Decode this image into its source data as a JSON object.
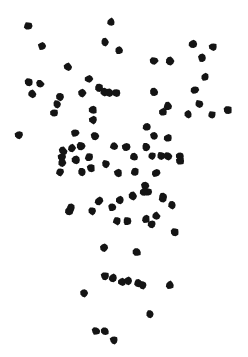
{
  "chart_data": {
    "type": "scatter",
    "title": "",
    "subtitle": "",
    "xlabel": "",
    "ylabel": "",
    "xlim": [
      0,
      248
    ],
    "ylim": [
      0,
      357
    ],
    "grid": false,
    "axes_visible": false,
    "tick_labels_x": [],
    "tick_labels_y": [],
    "legend": [],
    "legend_position": "none",
    "annotations": [],
    "marker": {
      "shape": "filled-irregular-circle",
      "color": "#141414",
      "size_px": 8
    },
    "background_color": "#ffffff",
    "point_count": 96,
    "series": [
      {
        "name": "points",
        "color": "#141414",
        "points": [
          [
            28,
            26
          ],
          [
            111,
            22
          ],
          [
            42,
            46
          ],
          [
            105,
            42
          ],
          [
            119,
            50
          ],
          [
            193,
            44
          ],
          [
            213,
            47
          ],
          [
            202,
            58
          ],
          [
            68,
            67
          ],
          [
            154,
            61
          ],
          [
            170,
            61
          ],
          [
            29,
            82
          ],
          [
            40,
            84
          ],
          [
            32,
            94
          ],
          [
            60,
            97
          ],
          [
            82,
            93
          ],
          [
            99,
            88
          ],
          [
            104,
            92
          ],
          [
            109,
            93
          ],
          [
            116,
            93
          ],
          [
            154,
            92
          ],
          [
            195,
            90
          ],
          [
            54,
            113
          ],
          [
            93,
            110
          ],
          [
            93,
            120
          ],
          [
            168,
            106
          ],
          [
            212,
            115
          ],
          [
            228,
            110
          ],
          [
            19,
            135
          ],
          [
            75,
            133
          ],
          [
            95,
            136
          ],
          [
            147,
            127
          ],
          [
            154,
            136
          ],
          [
            168,
            138
          ],
          [
            72,
            148
          ],
          [
            81,
            146
          ],
          [
            63,
            151
          ],
          [
            62,
            157
          ],
          [
            62,
            163
          ],
          [
            114,
            146
          ],
          [
            126,
            147
          ],
          [
            134,
            157
          ],
          [
            152,
            156
          ],
          [
            161,
            156
          ],
          [
            168,
            156
          ],
          [
            180,
            156
          ],
          [
            60,
            172
          ],
          [
            82,
            172
          ],
          [
            91,
            168
          ],
          [
            118,
            173
          ],
          [
            135,
            172
          ],
          [
            145,
            186
          ],
          [
            148,
            192
          ],
          [
            163,
            197
          ],
          [
            69,
            211
          ],
          [
            92,
            211
          ],
          [
            120,
            200
          ],
          [
            144,
            192
          ],
          [
            163,
            198
          ],
          [
            172,
            205
          ],
          [
            117,
            221
          ],
          [
            127,
            221
          ],
          [
            146,
            219
          ],
          [
            152,
            224
          ],
          [
            175,
            232
          ],
          [
            104,
            248
          ],
          [
            137,
            252
          ],
          [
            105,
            276
          ],
          [
            113,
            278
          ],
          [
            122,
            282
          ],
          [
            128,
            281
          ],
          [
            138,
            283
          ],
          [
            143,
            285
          ],
          [
            170,
            285
          ],
          [
            84,
            293
          ],
          [
            150,
            314
          ],
          [
            96,
            331
          ],
          [
            105,
            331
          ],
          [
            114,
            340
          ],
          [
            89,
            79
          ],
          [
            57,
            104
          ],
          [
            205,
            77
          ],
          [
            163,
            112
          ],
          [
            188,
            114
          ],
          [
            76,
            160
          ],
          [
            89,
            157
          ],
          [
            106,
            164
          ],
          [
            133,
            196
          ],
          [
            156,
            216
          ],
          [
            99,
            201
          ],
          [
            71,
            208
          ],
          [
            180,
            161
          ],
          [
            146,
            147
          ],
          [
            199,
            104
          ],
          [
            112,
            207
          ],
          [
            156,
            173
          ]
        ]
      }
    ]
  }
}
